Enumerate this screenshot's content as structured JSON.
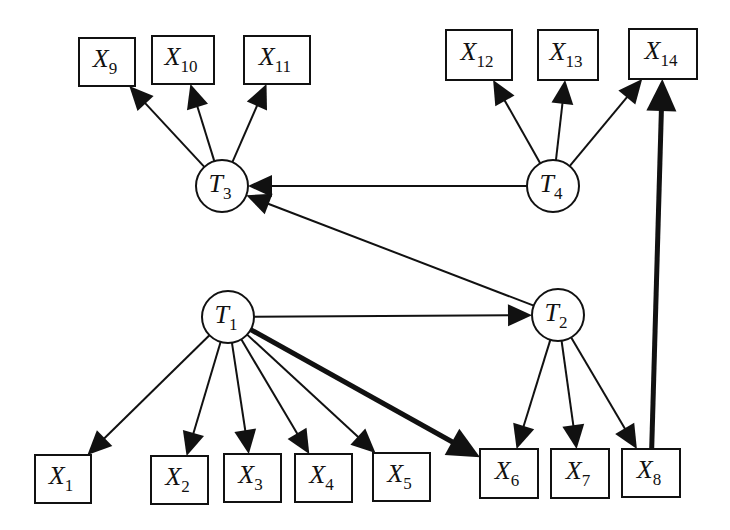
{
  "diagram": {
    "type": "directed-graph",
    "latent_nodes": [
      {
        "id": "T1",
        "base": "T",
        "sub": "1",
        "cx": 228,
        "cy": 317
      },
      {
        "id": "T2",
        "base": "T",
        "sub": "2",
        "cx": 558,
        "cy": 315
      },
      {
        "id": "T3",
        "base": "T",
        "sub": "3",
        "cx": 222,
        "cy": 186
      },
      {
        "id": "T4",
        "base": "T",
        "sub": "4",
        "cx": 553,
        "cy": 186
      }
    ],
    "observed_nodes": [
      {
        "id": "X1",
        "base": "X",
        "sub": "1",
        "x": 35,
        "y": 455,
        "w": 56,
        "h": 48
      },
      {
        "id": "X2",
        "base": "X",
        "sub": "2",
        "x": 151,
        "y": 456,
        "w": 57,
        "h": 48
      },
      {
        "id": "X3",
        "base": "X",
        "sub": "3",
        "x": 224,
        "y": 454,
        "w": 57,
        "h": 48
      },
      {
        "id": "X4",
        "base": "X",
        "sub": "4",
        "x": 295,
        "y": 454,
        "w": 57,
        "h": 48
      },
      {
        "id": "X5",
        "base": "X",
        "sub": "5",
        "x": 373,
        "y": 453,
        "w": 57,
        "h": 48
      },
      {
        "id": "X6",
        "base": "X",
        "sub": "6",
        "x": 480,
        "y": 449,
        "w": 58,
        "h": 49
      },
      {
        "id": "X7",
        "base": "X",
        "sub": "7",
        "x": 551,
        "y": 449,
        "w": 58,
        "h": 49
      },
      {
        "id": "X8",
        "base": "X",
        "sub": "8",
        "x": 622,
        "y": 449,
        "w": 58,
        "h": 48
      },
      {
        "id": "X9",
        "base": "X",
        "sub": "9",
        "x": 79,
        "y": 38,
        "w": 56,
        "h": 48
      },
      {
        "id": "X10",
        "base": "X",
        "sub": "10",
        "x": 152,
        "y": 36,
        "w": 62,
        "h": 48
      },
      {
        "id": "X11",
        "base": "X",
        "sub": "11",
        "x": 244,
        "y": 36,
        "w": 66,
        "h": 48
      },
      {
        "id": "X12",
        "base": "X",
        "sub": "12",
        "x": 446,
        "y": 30,
        "w": 66,
        "h": 50
      },
      {
        "id": "X13",
        "base": "X",
        "sub": "13",
        "x": 538,
        "y": 30,
        "w": 60,
        "h": 50
      },
      {
        "id": "X14",
        "base": "X",
        "sub": "14",
        "x": 629,
        "y": 29,
        "w": 68,
        "h": 50
      }
    ],
    "edges": [
      {
        "from": "T1",
        "to": "X1",
        "weight": "normal"
      },
      {
        "from": "T1",
        "to": "X2",
        "weight": "normal"
      },
      {
        "from": "T1",
        "to": "X3",
        "weight": "normal"
      },
      {
        "from": "T1",
        "to": "X4",
        "weight": "normal"
      },
      {
        "from": "T1",
        "to": "X5",
        "weight": "normal"
      },
      {
        "from": "T1",
        "to": "X6",
        "weight": "bold"
      },
      {
        "from": "T1",
        "to": "T2",
        "weight": "normal"
      },
      {
        "from": "T2",
        "to": "X6",
        "weight": "normal"
      },
      {
        "from": "T2",
        "to": "X7",
        "weight": "normal"
      },
      {
        "from": "T2",
        "to": "X8",
        "weight": "normal"
      },
      {
        "from": "T2",
        "to": "T3",
        "weight": "normal"
      },
      {
        "from": "T4",
        "to": "T3",
        "weight": "normal"
      },
      {
        "from": "T3",
        "to": "X9",
        "weight": "normal"
      },
      {
        "from": "T3",
        "to": "X10",
        "weight": "normal"
      },
      {
        "from": "T3",
        "to": "X11",
        "weight": "normal"
      },
      {
        "from": "T4",
        "to": "X12",
        "weight": "normal"
      },
      {
        "from": "T4",
        "to": "X13",
        "weight": "normal"
      },
      {
        "from": "T4",
        "to": "X14",
        "weight": "normal"
      },
      {
        "from": "X8",
        "to": "X14",
        "weight": "bold"
      }
    ],
    "colors": {
      "stroke": "#111111",
      "fill": "#ffffff",
      "background": "#ffffff"
    }
  }
}
